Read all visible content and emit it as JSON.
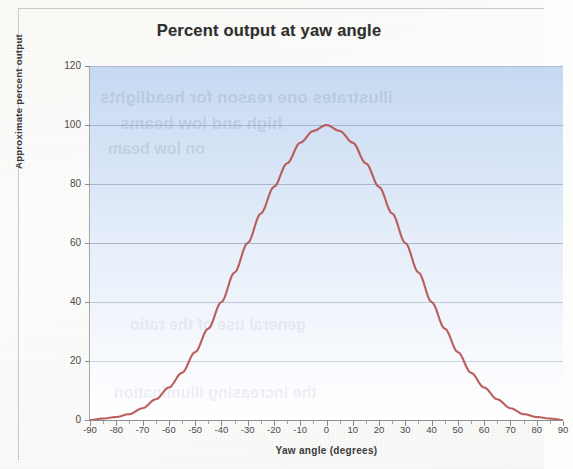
{
  "chart_data": {
    "type": "line",
    "title": "Percent output at yaw angle",
    "xlabel": "Yaw angle (degrees)",
    "ylabel": "Approximate percent output",
    "xlim": [
      -90,
      90
    ],
    "ylim": [
      0,
      120
    ],
    "x_tick_step": 10,
    "x_minor_tick_step": 5,
    "y_tick_step": 20,
    "grid": "horizontal",
    "legend": "none",
    "line_color": "#b5504f",
    "plot_background_top_color": "#c6d9f1",
    "plot_background_bottom_color": "#ffffff",
    "xticks": [
      -90,
      -80,
      -70,
      -60,
      -50,
      -40,
      -30,
      -20,
      -10,
      0,
      10,
      20,
      30,
      40,
      50,
      60,
      70,
      80,
      90
    ],
    "xtick_labels": [
      "-90",
      "-80",
      "-70",
      "-60",
      "-50",
      "-40",
      "-30",
      "-20",
      "-10",
      "0",
      "10",
      "20",
      "30",
      "40",
      "50",
      "60",
      "70",
      "80",
      "90"
    ],
    "yticks": [
      0,
      20,
      40,
      60,
      80,
      100,
      120
    ],
    "ytick_labels": [
      "0",
      "20",
      "40",
      "60",
      "80",
      "100",
      "120"
    ],
    "series": [
      {
        "name": "Approximate percent output",
        "x": [
          -90,
          -85,
          -80,
          -75,
          -70,
          -65,
          -60,
          -55,
          -50,
          -45,
          -40,
          -35,
          -30,
          -25,
          -20,
          -15,
          -10,
          -5,
          0,
          5,
          10,
          15,
          20,
          25,
          30,
          35,
          40,
          45,
          50,
          55,
          60,
          65,
          70,
          75,
          80,
          85,
          90
        ],
        "values": [
          0,
          0.5,
          1,
          2,
          4,
          7,
          11,
          16,
          23,
          31,
          40,
          50,
          60,
          70,
          79,
          87,
          94,
          98,
          100,
          98,
          94,
          87,
          79,
          70,
          60,
          50,
          40,
          31,
          23,
          16,
          11,
          7,
          4,
          2,
          1,
          0.5,
          0
        ]
      }
    ],
    "peak": {
      "x": 0,
      "y": 100
    }
  },
  "ghost_text": {
    "lines": [
      "illustrates one reason for headlights",
      "high and low beams",
      "on low beam",
      "general use of the ratio",
      "the increasing illumination"
    ]
  }
}
